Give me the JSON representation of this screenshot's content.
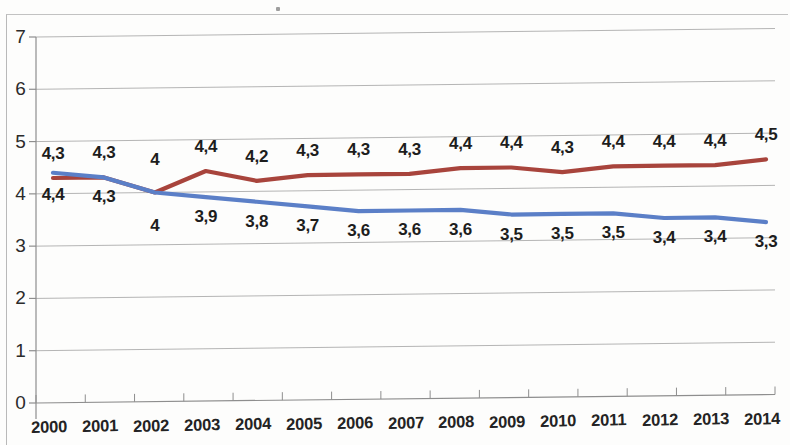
{
  "chart_data": {
    "type": "line",
    "title": "",
    "xlabel": "",
    "ylabel": "",
    "ylim": [
      0,
      7
    ],
    "ytick_labels": [
      "0",
      "1",
      "2",
      "3",
      "4",
      "5",
      "6",
      "7"
    ],
    "yticks": [
      0,
      1,
      2,
      3,
      4,
      5,
      6,
      7
    ],
    "grid": true,
    "legend": "none",
    "categories": [
      "2000",
      "2001",
      "2002",
      "2003",
      "2004",
      "2005",
      "2006",
      "2007",
      "2008",
      "2009",
      "2010",
      "2011",
      "2012",
      "2013",
      "2014"
    ],
    "series": [
      {
        "name": "red-series",
        "color": "#a8443c",
        "values": [
          4.3,
          4.3,
          4.0,
          4.4,
          4.2,
          4.3,
          4.3,
          4.3,
          4.4,
          4.4,
          4.3,
          4.4,
          4.4,
          4.4,
          4.5
        ],
        "labels": [
          "4,3",
          "4,3",
          "4",
          "4,4",
          "4,2",
          "4,3",
          "4,3",
          "4,3",
          "4,4",
          "4,4",
          "4,3",
          "4,4",
          "4,4",
          "4,4",
          "4,5"
        ],
        "label_position": "above"
      },
      {
        "name": "blue-series",
        "color": "#5b7fc7",
        "values": [
          4.4,
          4.3,
          4.0,
          3.9,
          3.8,
          3.7,
          3.6,
          3.6,
          3.6,
          3.5,
          3.5,
          3.5,
          3.4,
          3.4,
          3.3
        ],
        "labels": [
          "4,4",
          "4,3",
          "4",
          "3,9",
          "3,8",
          "3,7",
          "3,6",
          "3,6",
          "3,6",
          "3,5",
          "3,5",
          "3,5",
          "3,4",
          "3,4",
          "3,3"
        ],
        "label_position": "below"
      }
    ]
  },
  "colors": {
    "red_line": "#a8443c",
    "blue_line": "#5b7fc7",
    "gridline": "#9a9a9a",
    "axis": "#8e8e8e",
    "text": "#1d1d1d",
    "page_background": "#fdfdfc"
  },
  "marks": {
    "speck_label": "scan-speck"
  }
}
